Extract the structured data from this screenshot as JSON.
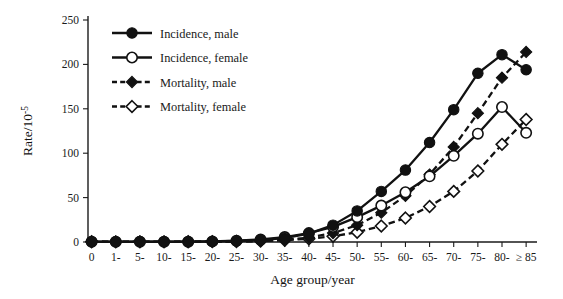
{
  "chart_data": {
    "type": "line",
    "title": "",
    "xlabel": "Age group/year",
    "ylabel": "Rate/10",
    "ylabel_exponent": "-5",
    "categories": [
      "0",
      "1-",
      "5-",
      "10-",
      "15-",
      "20-",
      "25-",
      "30-",
      "35-",
      "40-",
      "45-",
      "50-",
      "55-",
      "60-",
      "65-",
      "70-",
      "75-",
      "80-",
      "≥ 85"
    ],
    "ylim": [
      0,
      250
    ],
    "yticks": [
      0,
      50,
      100,
      150,
      200,
      250
    ],
    "ytick_labels": [
      "0",
      "50",
      "100",
      "150",
      "200",
      "250"
    ],
    "grid": false,
    "legend_position": "top-left",
    "series": [
      {
        "name": "Incidence, male",
        "marker": "filled-circle",
        "line_style": "solid",
        "color": "#111111",
        "values": [
          0.4,
          0.3,
          0.5,
          0.4,
          0.4,
          0.6,
          1.1,
          2.2,
          4.5,
          9.5,
          19.0,
          35.0,
          57.0,
          81.0,
          112.0,
          149.0,
          190.0,
          211.0,
          194.0
        ]
      },
      {
        "name": "Incidence, female",
        "marker": "open-circle",
        "line_style": "solid",
        "color": "#111111",
        "values": [
          0.4,
          0.2,
          0.3,
          0.3,
          0.4,
          0.7,
          1.4,
          2.8,
          5.5,
          10.0,
          17.0,
          28.0,
          41.0,
          56.0,
          74.0,
          97.0,
          122.0,
          152.0,
          123.0
        ]
      },
      {
        "name": "Mortality, male",
        "marker": "filled-diamond",
        "line_style": "dashed",
        "color": "#111111",
        "values": [
          0.3,
          0.3,
          0.4,
          0.3,
          0.3,
          0.4,
          0.6,
          1.2,
          2.4,
          5.0,
          10.0,
          19.0,
          33.0,
          52.0,
          76.0,
          107.0,
          145.0,
          185.0,
          214.0
        ]
      },
      {
        "name": "Mortality, female",
        "marker": "open-diamond",
        "line_style": "dashed",
        "color": "#111111",
        "values": [
          0.3,
          0.2,
          0.2,
          0.2,
          0.3,
          0.4,
          0.6,
          1.0,
          2.0,
          3.6,
          6.5,
          11.0,
          18.0,
          27.0,
          40.0,
          57.0,
          80.0,
          110.0,
          138.0
        ]
      }
    ]
  },
  "legend": {
    "items": [
      {
        "label": "Incidence, male"
      },
      {
        "label": "Incidence, female"
      },
      {
        "label": "Mortality, male"
      },
      {
        "label": "Mortality, female"
      }
    ]
  },
  "axes": {
    "y_title_main": "Rate/10",
    "y_title_sup": "-5",
    "x_title": "Age group/year"
  }
}
